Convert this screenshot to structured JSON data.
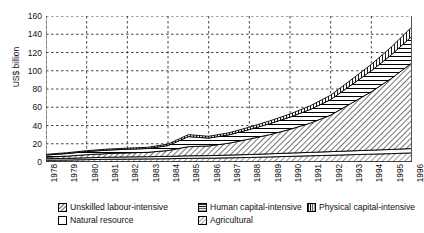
{
  "chart_data": {
    "type": "area",
    "stacked": true,
    "title": "",
    "xlabel": "",
    "ylabel": "US$ billion",
    "ylim": [
      0,
      160
    ],
    "ytick_values": [
      0,
      20,
      40,
      60,
      80,
      100,
      120,
      140,
      160
    ],
    "ytick_labels": [
      "0",
      "20",
      "40",
      "60",
      "80",
      "100",
      "120",
      "140",
      "160"
    ],
    "grid": true,
    "grid_style": "dotted",
    "legend_position": "bottom",
    "categories": [
      "1978",
      "1979",
      "1980",
      "1981",
      "1982",
      "1983",
      "1984",
      "1985",
      "1986",
      "1987",
      "1988",
      "1989",
      "1990",
      "1991",
      "1992",
      "1993",
      "1994",
      "1995",
      "1996"
    ],
    "x": [
      1978,
      1979,
      1980,
      1981,
      1982,
      1983,
      1984,
      1985,
      1986,
      1987,
      1988,
      1989,
      1990,
      1991,
      1992,
      1993,
      1994,
      1995,
      1996
    ],
    "series": [
      {
        "name": "Agricultural",
        "pattern": "light-dots",
        "values": [
          2.0,
          2.2,
          2.6,
          3.0,
          3.2,
          3.4,
          3.6,
          4.0,
          4.2,
          4.6,
          5.0,
          5.6,
          6.2,
          6.8,
          7.4,
          8.0,
          8.6,
          9.2,
          10.0
        ]
      },
      {
        "name": "Natural resource",
        "pattern": "blank",
        "values": [
          1.6,
          1.8,
          2.0,
          2.2,
          2.4,
          2.4,
          2.6,
          2.8,
          2.8,
          3.0,
          3.2,
          3.4,
          3.6,
          3.8,
          4.0,
          4.2,
          4.4,
          4.6,
          4.8
        ]
      },
      {
        "name": "Unskilled labour-intensive",
        "pattern": "diagonal-dense",
        "values": [
          1.8,
          2.4,
          3.4,
          4.0,
          4.4,
          4.8,
          6.4,
          10.0,
          10.6,
          13.0,
          17.0,
          21.0,
          26.0,
          32.0,
          40.0,
          52.0,
          64.0,
          78.0,
          94.0
        ]
      },
      {
        "name": "Human capital-intensive",
        "pattern": "horizontal-lines",
        "values": [
          2.2,
          2.8,
          3.4,
          3.8,
          4.0,
          4.2,
          5.4,
          11.0,
          8.6,
          9.2,
          10.4,
          12.0,
          13.4,
          15.0,
          17.0,
          20.0,
          23.0,
          26.0,
          29.0
        ]
      },
      {
        "name": "Physical capital-intensive",
        "pattern": "vertical-lines",
        "values": [
          0.8,
          0.9,
          1.0,
          1.1,
          1.2,
          1.3,
          1.6,
          2.2,
          2.0,
          2.2,
          2.6,
          3.0,
          3.4,
          4.0,
          4.8,
          5.8,
          7.0,
          8.6,
          10.4
        ]
      }
    ],
    "totals": [
      8.4,
      10.1,
      12.4,
      14.1,
      15.2,
      16.1,
      19.6,
      30.0,
      28.2,
      32.0,
      38.2,
      45.0,
      52.6,
      61.6,
      73.2,
      90.0,
      107.0,
      126.4,
      148.2
    ]
  },
  "legend": {
    "items": [
      {
        "label": "Unskilled labour-intensive",
        "icon": "swatch-diagonal-dense-icon"
      },
      {
        "label": "Human capital-intensive",
        "icon": "swatch-horizontal-lines-icon"
      },
      {
        "label": "Physical capital-intensive",
        "icon": "swatch-vertical-lines-icon"
      },
      {
        "label": "Natural resource",
        "icon": "swatch-blank-icon"
      },
      {
        "label": "Agricultural",
        "icon": "swatch-light-dots-icon"
      }
    ]
  },
  "colors": {
    "axis": "#000000",
    "grid": "#333333",
    "background": "#ffffff",
    "text": "#111111"
  }
}
